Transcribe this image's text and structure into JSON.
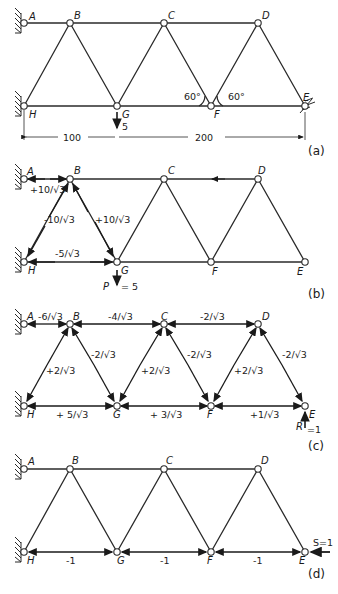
{
  "figure": {
    "panels": [
      {
        "id": "a",
        "caption": "(a)",
        "nodes": {
          "A": "A",
          "B": "B",
          "C": "C",
          "D": "D",
          "E": "E",
          "F": "F",
          "G": "G",
          "H": "H"
        },
        "load_label": "5",
        "angle_left": "60°",
        "angle_right": "60°",
        "dim_left": "100",
        "dim_right": "200"
      },
      {
        "id": "b",
        "caption": "(b)",
        "nodes": {
          "A": "A",
          "B": "B",
          "C": "C",
          "D": "D",
          "E": "E",
          "F": "F",
          "G": "G",
          "H": "H"
        },
        "forces": {
          "AB": "+10/√3",
          "BH": "-10/√3",
          "BG": "+10/√3",
          "HG": "-5/√3"
        },
        "load_name": "P",
        "load_value": "= 5"
      },
      {
        "id": "c",
        "caption": "(c)",
        "nodes": {
          "A": "A",
          "B": "B",
          "C": "C",
          "D": "D",
          "E": "E",
          "F": "F",
          "G": "G",
          "H": "H"
        },
        "forces": {
          "AB": "-6/√3",
          "BC": "-4/√3",
          "CD": "-2/√3",
          "BH": "+2/√3",
          "BG": "-2/√3",
          "CG": "+2/√3",
          "CF": "-2/√3",
          "DF": "+2/√3",
          "DE": "-2/√3",
          "HG": "+ 5/√3",
          "GF": "+ 3/√3",
          "FE": "+1/√3"
        },
        "reaction_name": "R",
        "reaction_value": "=1"
      },
      {
        "id": "d",
        "caption": "(d)",
        "nodes": {
          "A": "A",
          "B": "B",
          "C": "C",
          "D": "D",
          "E": "E",
          "F": "F",
          "G": "G",
          "H": "H"
        },
        "forces": {
          "HG": "-1",
          "GF": "-1",
          "FE": "-1"
        },
        "load_value": "S=1"
      }
    ]
  }
}
